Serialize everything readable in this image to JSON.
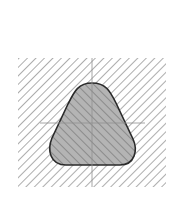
{
  "diagram": {
    "type": "cross-section",
    "colors": {
      "background": "#ffffff",
      "outer_hatch": "#8a8a8a",
      "section_fill": "#b4b4b4",
      "section_hatch": "#6e6e6e",
      "outline": "#2a2a2a",
      "centerline": "#9a9a9a"
    },
    "outer_region": {
      "x": 18,
      "y": 58,
      "width": 148,
      "height": 129,
      "hatch_direction": "\\"
    },
    "section": {
      "shape": "rounded-triangle",
      "hatch_direction": "/",
      "bounds": {
        "x": 50,
        "y": 83,
        "width": 86,
        "height": 82
      }
    },
    "centerlines": {
      "vertical": {
        "x": 92,
        "y1": 58,
        "y2": 187
      },
      "horizontal": {
        "y": 123,
        "x1": 40,
        "x2": 145
      }
    }
  }
}
